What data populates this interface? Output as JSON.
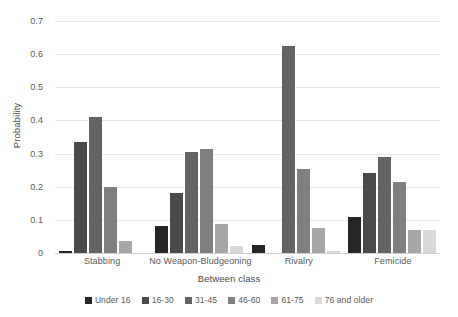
{
  "chart_data": {
    "type": "bar",
    "title": "",
    "subtitle": "",
    "xlabel": "Between class",
    "ylabel": "Probability",
    "ylim": [
      0,
      0.7
    ],
    "ytick_labels": [
      "0.7",
      "0.6",
      "0.5",
      "0.4",
      "0.3",
      "0.2",
      "0.1",
      "0"
    ],
    "ytick_values": [
      0.7,
      0.6,
      0.5,
      0.4,
      0.3,
      0.2,
      0.1,
      0
    ],
    "grid": true,
    "legend_position": "bottom",
    "categories": [
      "Stabbing",
      "No Weapon-Bludgeoning",
      "Rivalry",
      "Femicide"
    ],
    "series": [
      {
        "name": "Under 16",
        "color": "#262626",
        "values": [
          0.007,
          0.082,
          0.025,
          0.11
        ]
      },
      {
        "name": "16-30",
        "color": "#4a4a4a",
        "values": [
          0.335,
          0.18,
          0.0,
          0.24
        ]
      },
      {
        "name": "31-45",
        "color": "#636363",
        "values": [
          0.41,
          0.305,
          0.625,
          0.29
        ]
      },
      {
        "name": "46-60",
        "color": "#7f7f7f",
        "values": [
          0.2,
          0.313,
          0.255,
          0.215
        ]
      },
      {
        "name": "61-75",
        "color": "#a6a6a6",
        "values": [
          0.037,
          0.088,
          0.075,
          0.068
        ]
      },
      {
        "name": "76 and older",
        "color": "#d9d9d9",
        "values": [
          0.0,
          0.02,
          0.005,
          0.068
        ]
      }
    ]
  }
}
